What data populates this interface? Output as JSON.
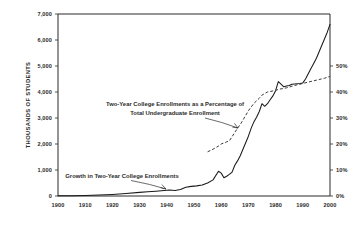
{
  "chart_data": {
    "type": "line",
    "title": "",
    "xlabel": "",
    "ylabel": "THOUSANDS OF STUDENTS",
    "y2label": "",
    "grid": false,
    "legend_position": "none",
    "xlim": [
      1900,
      2000
    ],
    "ylim": [
      0,
      7000
    ],
    "y2lim": [
      0,
      55
    ],
    "x_ticks": [
      1900,
      1910,
      1920,
      1930,
      1940,
      1950,
      1960,
      1970,
      1980,
      1990,
      2000
    ],
    "x_tick_labels": [
      "1900",
      "1910",
      "1920",
      "1930",
      "1940",
      "1950",
      "1960",
      "1970",
      "1980",
      "1990",
      "2000"
    ],
    "y_ticks": [
      0,
      1000,
      2000,
      3000,
      4000,
      5000,
      6000,
      7000
    ],
    "y_tick_labels": [
      "0",
      "1,000",
      "2,000",
      "3,000",
      "4,000",
      "5,000",
      "6,000",
      "7,000"
    ],
    "y2_ticks": [
      0,
      10,
      20,
      30,
      40,
      50
    ],
    "y2_tick_labels": [
      "0%",
      "10%",
      "20%",
      "30%",
      "40%",
      "50%"
    ],
    "series": [
      {
        "name": "Growth in Two-Year College Enrollments",
        "axis": "left",
        "style": "solid",
        "units": "thousands of students",
        "x": [
          1900,
          1905,
          1910,
          1915,
          1920,
          1925,
          1930,
          1933,
          1936,
          1939,
          1941,
          1943,
          1945,
          1947,
          1949,
          1951,
          1953,
          1955,
          1957,
          1959,
          1960,
          1961,
          1962,
          1963,
          1964,
          1965,
          1966,
          1967,
          1968,
          1969,
          1970,
          1971,
          1972,
          1973,
          1974,
          1975,
          1976,
          1977,
          1978,
          1979,
          1980,
          1981,
          1982,
          1983,
          1984,
          1985,
          1986,
          1987,
          1988,
          1989,
          1990,
          1991,
          1992,
          1993,
          1994,
          1995,
          1996,
          1997,
          1998,
          1999,
          2000
        ],
        "y": [
          8,
          12,
          20,
          35,
          60,
          95,
          140,
          160,
          185,
          210,
          230,
          215,
          250,
          340,
          370,
          390,
          420,
          500,
          620,
          950,
          880,
          700,
          760,
          830,
          920,
          1180,
          1350,
          1550,
          1800,
          2050,
          2300,
          2600,
          2850,
          3030,
          3250,
          3550,
          3450,
          3550,
          3700,
          3850,
          4050,
          4400,
          4300,
          4200,
          4230,
          4250,
          4300,
          4310,
          4320,
          4330,
          4350,
          4500,
          4700,
          4900,
          5100,
          5300,
          5550,
          5800,
          6050,
          6300,
          6600
        ]
      },
      {
        "name": "Two-Year College Enrollments as a Percentage of Total Undergraduate Enrollment",
        "axis": "right",
        "style": "dashed",
        "units": "percent",
        "x": [
          1955,
          1957,
          1959,
          1960,
          1961,
          1962,
          1963,
          1964,
          1965,
          1966,
          1967,
          1968,
          1969,
          1970,
          1971,
          1972,
          1973,
          1974,
          1975,
          1976,
          1977,
          1978,
          1979,
          1980,
          1981,
          1982,
          1983,
          1984,
          1985,
          1986,
          1987,
          1988,
          1989,
          1990,
          1992,
          1994,
          1996,
          1998,
          2000
        ],
        "y": [
          17.0,
          18.0,
          19.2,
          20.0,
          20.4,
          20.8,
          21.2,
          22.8,
          24.5,
          26.0,
          27.5,
          29.2,
          31.0,
          32.8,
          34.2,
          35.6,
          36.6,
          37.6,
          38.8,
          39.4,
          40.0,
          40.2,
          40.4,
          40.6,
          41.0,
          41.2,
          41.4,
          41.6,
          41.9,
          42.2,
          42.5,
          42.8,
          43.0,
          43.3,
          43.8,
          44.3,
          44.8,
          45.3,
          46.0
        ]
      }
    ],
    "annotations": [
      {
        "id": "pct-annotation",
        "lines": [
          "Two-Year College Enrollments as a Percentage of",
          "Total Undergraduate Enrollment"
        ],
        "target_series": "Two-Year College Enrollments as a Percentage of Total Undergraduate Enrollment"
      },
      {
        "id": "growth-annotation",
        "lines": [
          "Growth in Two-Year College Enrollments"
        ],
        "target_series": "Growth in Two-Year College Enrollments"
      }
    ]
  }
}
